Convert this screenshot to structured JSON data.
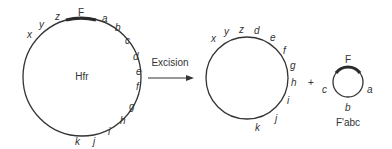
{
  "diagram": {
    "hfr": {
      "center_label": "Hfr",
      "f_label": "F",
      "genes": [
        "x",
        "y",
        "z",
        "a",
        "b",
        "c",
        "d",
        "e",
        "f",
        "g",
        "h",
        "i",
        "j",
        "k"
      ]
    },
    "arrow": {
      "label": "Excision"
    },
    "chromosome": {
      "genes": [
        "x",
        "y",
        "z",
        "d",
        "e",
        "f",
        "g",
        "h",
        "i",
        "j",
        "k"
      ]
    },
    "plus": "+",
    "fprime": {
      "f_label": "F",
      "genes": [
        "a",
        "b",
        "c"
      ],
      "caption": "F'abc"
    },
    "colors": {
      "line": "#333333",
      "f_segment": "#2a2a2a",
      "text": "#333333"
    }
  }
}
